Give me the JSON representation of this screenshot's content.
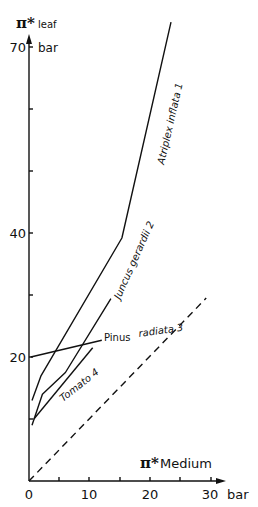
{
  "chart_data": {
    "type": "line",
    "title": "",
    "xlabel": "π* Medium",
    "xunit": "bar",
    "ylabel": "π* leaf",
    "yunit": "bar",
    "xlim": [
      0,
      32
    ],
    "ylim": [
      0,
      75
    ],
    "x_ticks": [
      0,
      10,
      20,
      30
    ],
    "x_minor_ticks": [
      5,
      15,
      25
    ],
    "y_ticks_labeled": [
      20,
      40,
      70
    ],
    "y_ticks": [
      10,
      20,
      30,
      40,
      50,
      60,
      70
    ],
    "grid": false,
    "legend": "inline labels along lines",
    "series": [
      {
        "name": "Atriplex inflata",
        "ref": "1",
        "points": [
          [
            0.5,
            13
          ],
          [
            2,
            17
          ],
          [
            15.3,
            39.2
          ],
          [
            23.4,
            74
          ]
        ]
      },
      {
        "name": "Juncus gerardii",
        "ref": "2",
        "points": [
          [
            0.5,
            9
          ],
          [
            2.2,
            14
          ],
          [
            6,
            17.5
          ],
          [
            13.5,
            29.4
          ]
        ]
      },
      {
        "name": "Pinus radiata",
        "ref": "3",
        "points": [
          [
            0.3,
            20
          ],
          [
            12,
            22.7
          ]
        ]
      },
      {
        "name": "Tomato",
        "ref": "4",
        "points": [
          [
            0.8,
            10
          ],
          [
            10.5,
            21.5
          ]
        ]
      },
      {
        "name": "1:1 reference (π*leaf = π*medium)",
        "style": "dashed",
        "points": [
          [
            0,
            0
          ],
          [
            29.2,
            29.5
          ]
        ]
      }
    ]
  },
  "labels": {
    "y_pi": "π*",
    "y_sub": "leaf",
    "y_unit": "bar",
    "x_pi": "π*",
    "x_text": "Medium",
    "x_unit": "bar",
    "x_tick_0": "0",
    "x_tick_10": "10",
    "x_tick_20": "20",
    "x_tick_30": "30",
    "y_tick_20": "20",
    "y_tick_40": "40",
    "y_tick_70": "70",
    "atriplex": "Atriplex  inflata 1",
    "juncus": "Juncus  gerardii 2",
    "pinus_a": "Pinus",
    "pinus_b": "radiata 3",
    "tomato": "Tomato 4"
  }
}
